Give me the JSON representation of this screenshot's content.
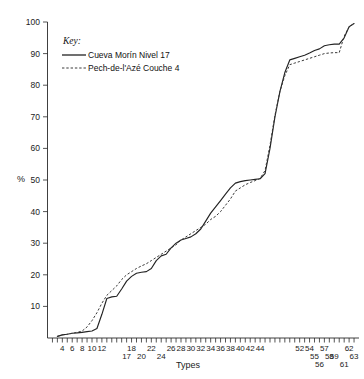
{
  "chart_data": {
    "type": "line",
    "title": "",
    "xlabel": "Types",
    "ylabel": "%",
    "ylim": [
      0,
      100
    ],
    "xlim": [
      1,
      64
    ],
    "grid": false,
    "legend_position": "upper-left-inside",
    "legend_title": "Key:",
    "y_ticks": [
      10,
      20,
      30,
      40,
      50,
      60,
      70,
      80,
      90,
      100
    ],
    "y_tick_labels": [
      "10",
      "20",
      "30",
      "40",
      "50",
      "60",
      "70",
      "80",
      "90",
      "100"
    ],
    "x_tick_labels_row1": [
      "4",
      "6",
      "8",
      "10",
      "12",
      "18",
      "22",
      "26",
      "28",
      "30",
      "32",
      "34",
      "36",
      "38",
      "40",
      "42",
      "44",
      "52",
      "54",
      "57",
      "62"
    ],
    "x_tick_labels_row2": [
      "17",
      "20",
      "24",
      "55",
      "58",
      "59",
      "63"
    ],
    "x_tick_labels_row3": [
      "56",
      "61"
    ],
    "series": [
      {
        "name": "Cueva Morín Nivel 17",
        "style": "solid",
        "color": "#232323",
        "x": [
          3,
          4,
          5,
          6,
          7,
          8,
          9,
          10,
          11,
          12,
          13,
          14,
          15,
          16,
          17,
          18,
          19,
          20,
          21,
          22,
          23,
          24,
          25,
          26,
          27,
          28,
          29,
          30,
          31,
          32,
          33,
          34,
          35,
          36,
          37,
          38,
          39,
          40,
          41,
          42,
          43,
          44,
          45,
          46,
          47,
          48,
          49,
          50,
          51,
          52,
          53,
          54,
          55,
          56,
          57,
          58,
          59,
          60,
          61,
          62,
          63
        ],
        "y": [
          0.5,
          1.0,
          1.2,
          1.5,
          1.6,
          1.8,
          2.0,
          2.2,
          3.0,
          7.5,
          12.5,
          13.0,
          13.2,
          15.5,
          18.0,
          19.5,
          20.5,
          20.8,
          21.0,
          22.0,
          24.5,
          26.0,
          26.5,
          28.5,
          30.0,
          31.0,
          31.5,
          32.0,
          33.0,
          34.5,
          37.0,
          39.5,
          41.5,
          43.5,
          45.5,
          47.5,
          49.0,
          49.5,
          49.8,
          50.0,
          50.2,
          50.4,
          52.0,
          60.0,
          70.0,
          78.0,
          84.0,
          88.0,
          88.5,
          89.0,
          89.5,
          90.2,
          91.0,
          91.5,
          92.5,
          92.8,
          93.0,
          93.0,
          95.0,
          98.5,
          99.5
        ]
      },
      {
        "name": "Pech-de-l'Azé Couche 4",
        "style": "dashed",
        "color": "#3a3a3a",
        "x": [
          3,
          4,
          5,
          6,
          7,
          8,
          9,
          10,
          11,
          12,
          13,
          14,
          15,
          16,
          17,
          18,
          19,
          20,
          21,
          22,
          23,
          24,
          25,
          26,
          27,
          28,
          29,
          30,
          31,
          32,
          33,
          34,
          35,
          36,
          37,
          38,
          39,
          40,
          41,
          42,
          43,
          44,
          45,
          46,
          47,
          48,
          49,
          50,
          51,
          52,
          53,
          54,
          55,
          56,
          57,
          58,
          59,
          60,
          61,
          62,
          63
        ],
        "y": [
          0.5,
          1.0,
          1.2,
          1.5,
          1.8,
          2.2,
          3.5,
          5.5,
          8.0,
          11.0,
          13.5,
          15.0,
          16.5,
          18.5,
          20.0,
          21.0,
          22.0,
          22.8,
          23.5,
          24.5,
          25.5,
          26.5,
          27.5,
          28.5,
          29.5,
          31.0,
          32.0,
          33.0,
          34.0,
          35.0,
          36.0,
          37.5,
          38.5,
          40.0,
          42.0,
          44.0,
          46.5,
          47.5,
          48.5,
          49.2,
          49.8,
          50.5,
          53.0,
          61.0,
          70.5,
          78.0,
          83.0,
          86.5,
          87.0,
          87.5,
          88.0,
          88.5,
          89.0,
          89.5,
          90.0,
          90.2,
          90.3,
          90.3,
          95.5,
          98.5,
          99.5
        ]
      }
    ]
  },
  "legend": {
    "title": "Key:",
    "entries": [
      {
        "label": "Cueva Morín Nivel 17",
        "style": "solid"
      },
      {
        "label": "Pech-de-l'Azé Couche 4",
        "style": "dashed"
      }
    ]
  },
  "axes": {
    "y_axis_label": "%",
    "x_axis_label": "Types"
  }
}
